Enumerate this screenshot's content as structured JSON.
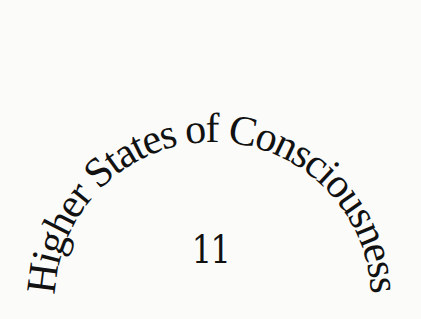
{
  "page": {
    "chapter_title": "Higher States of Consciousness",
    "chapter_number": "11"
  },
  "colors": {
    "background": "#fbfbfa",
    "text": "#111111"
  }
}
